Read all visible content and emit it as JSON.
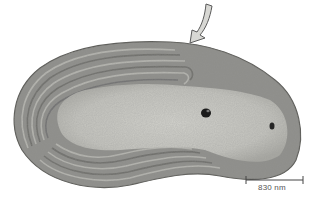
{
  "image": {
    "description": "Transmission electron micrograph of an elongated bacterial cell with concentric internal membranes (thylakoid-like lamellae) along the periphery",
    "background": "#ffffff",
    "colors": {
      "cell_outer": "#8a8a86",
      "cytoplasm": "#c9c9c3",
      "lamellae_dark": "#6e6e6a",
      "lamellae_light": "#b4b4ae",
      "granule": "#1a1a1a",
      "arrow_fill": "#d8d8d4",
      "arrow_stroke": "#5a5a5a"
    }
  },
  "annotations": {
    "arrow": {
      "points_to": "cell membrane / lamella end",
      "tip": [
        190,
        42
      ]
    },
    "scale_bar": {
      "label": "830 nm",
      "x1": 246,
      "x2": 303,
      "y": 180
    }
  }
}
